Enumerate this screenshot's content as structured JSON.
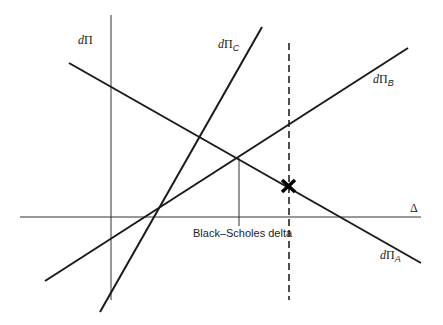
{
  "diagram": {
    "colors": {
      "background": "#ffffff",
      "line": "#1a1a1a",
      "axis": "#333333"
    },
    "axes": {
      "vertical_label": {
        "d": "d",
        "pi": "Π"
      },
      "horizontal_label": "Δ"
    },
    "lines": [
      {
        "id": "A",
        "label_d": "d",
        "label_pi": "Π",
        "label_sub": "A"
      },
      {
        "id": "B",
        "label_d": "d",
        "label_pi": "Π",
        "label_sub": "B"
      },
      {
        "id": "C",
        "label_d": "d",
        "label_pi": "Π",
        "label_sub": "C"
      }
    ],
    "annotations": {
      "black_scholes_label": "Black–Scholes delta",
      "marker": "cross-mark"
    }
  }
}
